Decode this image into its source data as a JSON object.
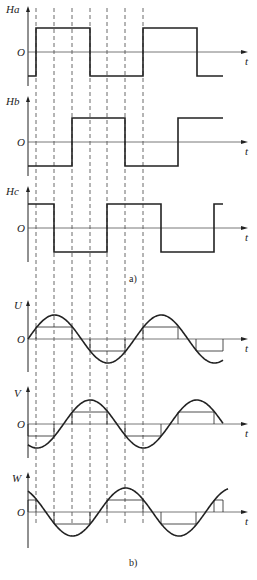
{
  "figure": {
    "caption_a": "a)",
    "caption_b": "b)",
    "zero_label": "O",
    "time_label": "t"
  },
  "colors": {
    "ink": "#222222",
    "axis": "#555555",
    "dash": "#444444",
    "background": "#ffffff"
  },
  "dashed_lines_x": [
    36,
    54,
    72,
    90,
    107,
    125,
    143
  ],
  "panels": [
    {
      "id": "Ha",
      "label": "Ha",
      "type": "square",
      "zero_y": 52,
      "amp": 24,
      "axis_top": 6,
      "axis_bottom": 86,
      "segments": [
        [
          28,
          36,
          -1
        ],
        [
          36,
          90,
          1
        ],
        [
          90,
          143,
          -1
        ],
        [
          143,
          197,
          1
        ],
        [
          197,
          223,
          -1
        ]
      ]
    },
    {
      "id": "Hb",
      "label": "Hb",
      "type": "square",
      "zero_y": 142,
      "amp": 24,
      "axis_top": 96,
      "axis_bottom": 176,
      "segments": [
        [
          28,
          72,
          -1
        ],
        [
          72,
          125,
          1
        ],
        [
          125,
          178,
          -1
        ],
        [
          178,
          223,
          1
        ]
      ]
    },
    {
      "id": "Hc",
      "label": "Hc",
      "type": "square",
      "zero_y": 228,
      "amp": 24,
      "axis_top": 186,
      "axis_bottom": 262,
      "segments": [
        [
          28,
          54,
          1
        ],
        [
          54,
          107,
          -1
        ],
        [
          107,
          161,
          1
        ],
        [
          161,
          214,
          -1
        ],
        [
          214,
          223,
          1
        ]
      ]
    },
    {
      "id": "U",
      "label": "U",
      "type": "sine",
      "zero_y": 339,
      "amp": 24,
      "step": 12,
      "axis_top": 300,
      "axis_bottom": 372,
      "phase_deg": 0,
      "x_end": 223,
      "steps": [
        [
          36,
          72,
          1
        ],
        [
          90,
          125,
          -1
        ],
        [
          143,
          178,
          1
        ],
        [
          196,
          223,
          -1
        ]
      ]
    },
    {
      "id": "V",
      "label": "V",
      "type": "sine",
      "zero_y": 424,
      "amp": 24,
      "step": 12,
      "axis_top": 386,
      "axis_bottom": 458,
      "phase_deg": -120,
      "x_end": 223,
      "steps": [
        [
          28,
          54,
          -1
        ],
        [
          72,
          107,
          1
        ],
        [
          125,
          161,
          -1
        ],
        [
          178,
          214,
          1
        ]
      ]
    },
    {
      "id": "W",
      "label": "W",
      "type": "sine",
      "zero_y": 512,
      "amp": 24,
      "step": 12,
      "axis_top": 472,
      "axis_bottom": 548,
      "phase_deg": 120,
      "x_end": 228,
      "steps": [
        [
          28,
          36,
          1
        ],
        [
          54,
          90,
          -1
        ],
        [
          107,
          143,
          1
        ],
        [
          161,
          196,
          -1
        ],
        [
          214,
          223,
          1
        ]
      ]
    }
  ],
  "layout": {
    "axis_x": 28,
    "axis_end_x": 248,
    "period_px": 106.6,
    "dash_top": 8,
    "dash_bottom": 526
  }
}
